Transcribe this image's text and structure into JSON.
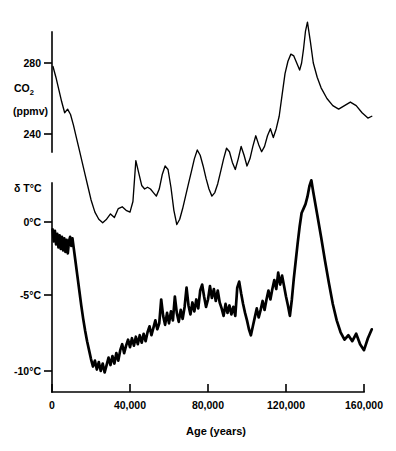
{
  "chart_data": {
    "type": "line",
    "title": "",
    "xlabel": "Age (years)",
    "xlim": [
      0,
      165000
    ],
    "xticks": [
      0,
      40000,
      80000,
      120000,
      160000
    ],
    "xticklabels": [
      "0",
      "40,000",
      "80,000",
      "120,000",
      "160,000"
    ],
    "grid": false,
    "legend": "none",
    "series": [
      {
        "name": "CO2",
        "ylabel_main": "CO",
        "ylabel_sub": "2",
        "ylabel_units": "(ppmv)",
        "yticks": [
          240,
          280
        ],
        "yticklabels": [
          "240",
          "280"
        ],
        "ylim": [
          180,
          310
        ],
        "x": [
          500,
          2000,
          3500,
          5000,
          6500,
          8000,
          9500,
          11000,
          12500,
          14000,
          15500,
          17000,
          18500,
          20000,
          22000,
          24000,
          26000,
          28000,
          30000,
          32000,
          34000,
          36000,
          38000,
          40000,
          41500,
          43000,
          44500,
          46000,
          47500,
          49000,
          50500,
          52000,
          53500,
          55000,
          56500,
          58000,
          59500,
          61000,
          62500,
          64000,
          65500,
          67000,
          68500,
          70000,
          71500,
          73000,
          74500,
          76000,
          77500,
          79000,
          80500,
          82000,
          83500,
          85000,
          86500,
          88000,
          89500,
          91000,
          92500,
          94000,
          95500,
          97000,
          98500,
          100000,
          101500,
          103000,
          104500,
          106000,
          107500,
          109000,
          110500,
          112000,
          113500,
          115000,
          116500,
          118000,
          119500,
          121000,
          122500,
          124000,
          125500,
          127000,
          128000,
          129000,
          130000,
          131000,
          132500,
          134000,
          136000,
          138000,
          141000,
          144000,
          147000,
          150000,
          153000,
          156000,
          159000,
          162000,
          164000
        ],
        "y": [
          278,
          272,
          265,
          258,
          252,
          254,
          251,
          245,
          238,
          231,
          224,
          217,
          210,
          203,
          196,
          192,
          190,
          192,
          195,
          193,
          198,
          199,
          197,
          196,
          202,
          225,
          218,
          211,
          209,
          210,
          209,
          207,
          205,
          209,
          217,
          222,
          220,
          210,
          197,
          189,
          192,
          198,
          205,
          212,
          219,
          226,
          231,
          228,
          222,
          215,
          209,
          205,
          207,
          212,
          219,
          226,
          232,
          230,
          224,
          220,
          226,
          233,
          228,
          222,
          226,
          233,
          239,
          234,
          230,
          233,
          239,
          243,
          238,
          243,
          250,
          262,
          274,
          281,
          285,
          284,
          280,
          276,
          280,
          288,
          298,
          303,
          292,
          280,
          272,
          266,
          260,
          256,
          254,
          256,
          258,
          256,
          252,
          249,
          250
        ]
      },
      {
        "name": "delta T",
        "ylabel_main": "δ T°C",
        "yticks": [
          -10,
          -5,
          0
        ],
        "yticklabels": [
          "-10°C",
          "-5°C",
          "0°C"
        ],
        "ylim": [
          -11.5,
          3.0
        ],
        "x": [
          300,
          900,
          1500,
          2100,
          2700,
          3300,
          3900,
          4500,
          5100,
          5700,
          6300,
          6900,
          7500,
          8100,
          8700,
          9300,
          9900,
          10500,
          11200,
          12000,
          13000,
          14000,
          15000,
          16000,
          17000,
          18000,
          19000,
          20000,
          21000,
          22000,
          23000,
          24000,
          25000,
          26000,
          27000,
          28000,
          29000,
          30000,
          31000,
          32000,
          33000,
          34000,
          35000,
          36000,
          37000,
          38000,
          39000,
          40000,
          41000,
          42000,
          43000,
          44000,
          45000,
          46000,
          47000,
          48000,
          49000,
          50000,
          51000,
          52000,
          53000,
          54000,
          55000,
          56000,
          57000,
          58000,
          59000,
          60000,
          61000,
          62000,
          63000,
          64000,
          65000,
          66000,
          67000,
          68000,
          69000,
          70000,
          71000,
          72000,
          73000,
          74000,
          75000,
          76000,
          77000,
          78000,
          79000,
          80000,
          81000,
          82000,
          83000,
          84000,
          85000,
          86000,
          87000,
          88000,
          89000,
          90000,
          91000,
          92000,
          93000,
          94000,
          95000,
          96000,
          97000,
          98000,
          99000,
          100000,
          101000,
          102000,
          103000,
          104000,
          105000,
          106000,
          107000,
          108000,
          109000,
          110000,
          111000,
          112000,
          113000,
          114000,
          115000,
          116000,
          117000,
          118000,
          119000,
          120000,
          121000,
          122000,
          123000,
          124000,
          125000,
          126000,
          127000,
          128000,
          129000,
          130000,
          131000,
          132000,
          133000,
          134000,
          136000,
          138000,
          140000,
          142000,
          144000,
          146000,
          148000,
          150000,
          152000,
          154000,
          156000,
          158000,
          160000,
          162000,
          164000
        ],
        "y": [
          -0.5,
          -1.3,
          -0.6,
          -1.5,
          -0.8,
          -1.7,
          -0.9,
          -1.8,
          -1.0,
          -1.9,
          -1.1,
          -2.0,
          -1.2,
          -2.1,
          -1.3,
          -1.0,
          -1.6,
          -1.1,
          -1.8,
          -2.6,
          -3.6,
          -4.6,
          -5.6,
          -6.5,
          -7.3,
          -8.0,
          -8.6,
          -9.2,
          -9.7,
          -9.3,
          -9.9,
          -9.4,
          -10.0,
          -9.5,
          -10.1,
          -9.6,
          -9.1,
          -9.6,
          -9.0,
          -9.5,
          -8.8,
          -9.3,
          -8.6,
          -8.2,
          -8.8,
          -8.3,
          -7.9,
          -8.4,
          -7.8,
          -8.3,
          -7.7,
          -8.2,
          -7.6,
          -8.1,
          -7.5,
          -8.0,
          -7.4,
          -7.0,
          -7.6,
          -7.1,
          -6.6,
          -7.2,
          -6.8,
          -5.2,
          -6.3,
          -6.9,
          -6.1,
          -6.8,
          -6.0,
          -6.6,
          -5.0,
          -6.1,
          -6.7,
          -5.9,
          -6.5,
          -5.7,
          -4.4,
          -5.6,
          -6.2,
          -5.4,
          -6.0,
          -5.2,
          -5.8,
          -4.6,
          -4.2,
          -5.0,
          -5.7,
          -5.2,
          -4.3,
          -5.1,
          -4.5,
          -5.3,
          -4.6,
          -5.4,
          -5.8,
          -6.3,
          -5.5,
          -6.1,
          -5.6,
          -6.2,
          -5.7,
          -6.3,
          -4.4,
          -4.0,
          -4.8,
          -5.5,
          -6.1,
          -6.6,
          -7.2,
          -7.6,
          -7.0,
          -6.4,
          -5.8,
          -6.4,
          -5.9,
          -5.3,
          -5.9,
          -5.2,
          -4.6,
          -5.2,
          -4.5,
          -3.9,
          -4.5,
          -3.4,
          -4.2,
          -3.6,
          -4.3,
          -5.0,
          -5.6,
          -6.3,
          -5.2,
          -3.8,
          -2.6,
          -1.4,
          -0.3,
          0.6,
          0.9,
          1.2,
          1.7,
          2.4,
          2.8,
          2.0,
          0.5,
          -1.0,
          -2.6,
          -4.1,
          -5.5,
          -6.6,
          -7.4,
          -7.9,
          -7.6,
          -8.0,
          -7.5,
          -8.2,
          -8.6,
          -7.8,
          -7.2
        ]
      }
    ]
  },
  "axes": {
    "x_title": "Age (years)",
    "co2_title_main": "CO",
    "co2_title_sub": "2",
    "co2_title_units": "(ppmv)",
    "temp_title": "δ T°C",
    "co2_tick_280": "280",
    "co2_tick_240": "240",
    "temp_tick_0": "0°C",
    "temp_tick_m5": "-5°C",
    "temp_tick_m10": "-10°C",
    "x_tick_0": "0",
    "x_tick_40k": "40,000",
    "x_tick_80k": "80,000",
    "x_tick_120k": "120,000",
    "x_tick_160k": "160,000"
  },
  "colors": {
    "ink": "#000000",
    "background": "#ffffff"
  }
}
